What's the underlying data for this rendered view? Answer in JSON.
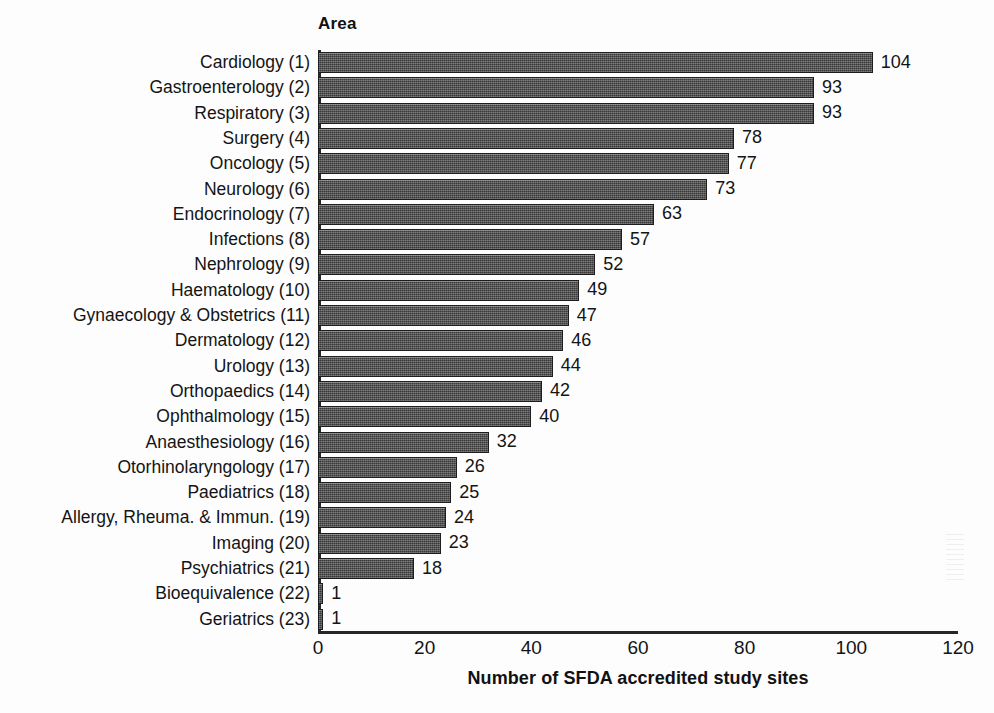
{
  "header": {
    "area_label": "Area"
  },
  "chart_data": {
    "type": "bar",
    "orientation": "horizontal",
    "title": "",
    "xlabel": "Number of SFDA accredited study sites",
    "ylabel": "Area",
    "xlim": [
      0,
      120
    ],
    "xticks": [
      0,
      20,
      40,
      60,
      80,
      100,
      120
    ],
    "xtick_labels": [
      "0",
      "20",
      "40",
      "60",
      "80",
      "100",
      "120"
    ],
    "grid": false,
    "legend": null,
    "bar_color": "#4a4a4a",
    "axis_color": "#262626",
    "background_color": "#fdfdfd",
    "categories": [
      "Cardiology (1)",
      "Gastroenterology (2)",
      "Respiratory (3)",
      "Surgery (4)",
      "Oncology (5)",
      "Neurology (6)",
      "Endocrinology (7)",
      "Infections (8)",
      "Nephrology (9)",
      "Haematology (10)",
      "Gynaecology & Obstetrics (11)",
      "Dermatology (12)",
      "Urology (13)",
      "Orthopaedics (14)",
      "Ophthalmology (15)",
      "Anaesthesiology (16)",
      "Otorhinolaryngology (17)",
      "Paediatrics (18)",
      "Allergy, Rheuma. & Immun. (19)",
      "Imaging (20)",
      "Psychiatrics (21)",
      "Bioequivalence (22)",
      "Geriatrics (23)"
    ],
    "values": [
      104,
      93,
      93,
      78,
      77,
      73,
      63,
      57,
      52,
      49,
      47,
      46,
      44,
      42,
      40,
      32,
      26,
      25,
      24,
      23,
      18,
      1,
      1
    ],
    "value_labels": [
      "104",
      "93",
      "93",
      "78",
      "77",
      "73",
      "63",
      "57",
      "52",
      "49",
      "47",
      "46",
      "44",
      "42",
      "40",
      "32",
      "26",
      "25",
      "24",
      "23",
      "18",
      "1",
      "1"
    ]
  }
}
